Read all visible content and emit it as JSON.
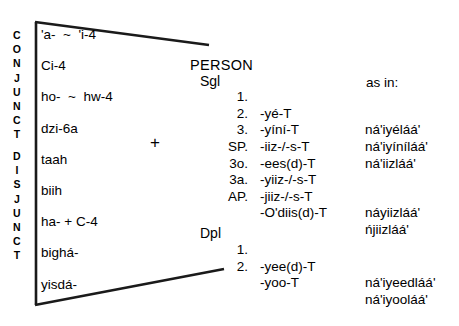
{
  "figure": {
    "side_labels": {
      "conjunct": "CONJUNCT",
      "disjunct": "DISJUNCT"
    },
    "plus_sign": "+",
    "affixes": [
      "'a-  ~  'i-4",
      "Ci-4",
      "ho-  ~  hw-4",
      "dzi-6a",
      "taah",
      "biih",
      "ha- + C-4",
      "bighá-",
      "yisdá-"
    ],
    "headers": {
      "person": "PERSON",
      "as_in": "as in:"
    },
    "singular": {
      "group_label": "Sgl",
      "rows": [
        {
          "person": "1.",
          "suffix": "-yé-T",
          "example": "ná'iyéláá'"
        },
        {
          "person": "2.",
          "suffix": "-yíní-T",
          "example": "ná'iyíníláá'"
        },
        {
          "person": "3.",
          "suffix": "-iiz-/-s-T",
          "example": "ná'iizláá'"
        },
        {
          "person": "SP.",
          "suffix": "-ees(d)-T",
          "example": ""
        },
        {
          "person": "3o.",
          "suffix": "-yiiz-/-s-T",
          "example": ""
        },
        {
          "person": "3a.",
          "suffix": "-jiiz-/-s-T",
          "example": "náyiizláá'"
        },
        {
          "person": "AP.",
          "suffix": "-O'diis(d)-T",
          "example": "ńjiizláá'"
        }
      ]
    },
    "dual_plural": {
      "group_label": "Dpl",
      "rows": [
        {
          "person": "1.",
          "suffix": "-yee(d)-T",
          "example": "ná'iyeedláá'"
        },
        {
          "person": "2.",
          "suffix": "-yoo-T",
          "example": "ná'iyooláá'"
        }
      ]
    }
  }
}
